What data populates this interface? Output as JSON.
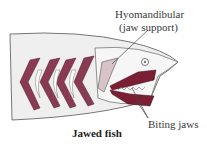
{
  "diagram": {
    "title": "Jawed fish",
    "labels": {
      "hyomandibular_line1": "Hyomandibular",
      "hyomandibular_line2": "(jaw support)",
      "biting_jaws": "Biting jaws"
    },
    "colors": {
      "gill_arch": "#8a3a52",
      "jaw": "#7a1f33",
      "hyomandibular": "#d8c4c8",
      "body_fill": "#efefef",
      "outline": "#555555"
    }
  }
}
